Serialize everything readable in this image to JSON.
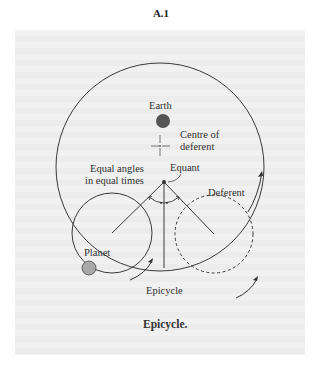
{
  "figure": {
    "number": "A.1",
    "caption": "Epicycle."
  },
  "labels": {
    "earth": "Earth",
    "centre_line1": "Centre of",
    "centre_line2": "deferent",
    "equant": "Equant",
    "equal_line1": "Equal angles",
    "equal_line2": "in equal times",
    "deferent": "Deferent",
    "planet": "Planet",
    "epicycle": "Epicycle"
  },
  "colors": {
    "line": "#3a3a3a",
    "earth_fill": "#555555",
    "planet_fill": "#a8a8a8"
  }
}
